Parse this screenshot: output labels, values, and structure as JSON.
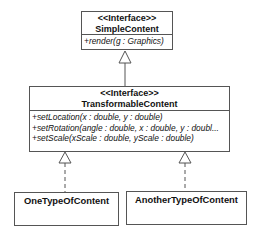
{
  "diagram": {
    "type": "uml-class",
    "classes": [
      {
        "stereotype": "<<Interface>>",
        "name": "SimpleContent",
        "operations": [
          "+render(g : Graphics)"
        ]
      },
      {
        "stereotype": "<<Interface>>",
        "name": "TransformableContent",
        "operations": [
          "+setLocation(x : double, y : double)",
          "+setRotation(angle : double, x : double, y : doubl...",
          "+setScale(xScale : double, yScale : double)"
        ]
      },
      {
        "name": "OneTypeOfContent",
        "operations": []
      },
      {
        "name": "AnotherTypeOfContent",
        "operations": []
      }
    ],
    "relations": [
      {
        "from": "TransformableContent",
        "to": "SimpleContent",
        "kind": "generalization",
        "style": "solid"
      },
      {
        "from": "OneTypeOfContent",
        "to": "TransformableContent",
        "kind": "realization",
        "style": "dashed"
      },
      {
        "from": "AnotherTypeOfContent",
        "to": "TransformableContent",
        "kind": "realization",
        "style": "dashed"
      }
    ],
    "colors": {
      "line": "#555555",
      "background": "#ffffff",
      "text": "#111111"
    }
  }
}
